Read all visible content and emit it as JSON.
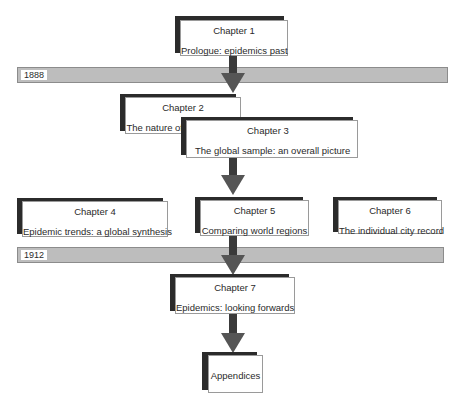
{
  "chapters": [
    {
      "title": "Chapter 1",
      "subtitle": "Prologue: epidemics past"
    },
    {
      "title": "Chapter 2",
      "subtitle": "The nature of the evidence"
    },
    {
      "title": "Chapter 3",
      "subtitle": "The global sample: an overall picture"
    },
    {
      "title": "Chapter 4",
      "subtitle": "Epidemic trends: a global synthesis"
    },
    {
      "title": "Chapter 5",
      "subtitle": "Comparing world regions"
    },
    {
      "title": "Chapter 6",
      "subtitle": "The individual city record"
    },
    {
      "title": "Chapter 7",
      "subtitle": "Epidemics: looking forwards"
    }
  ],
  "appendices": {
    "label": "Appendices"
  },
  "timeline": [
    {
      "year": "1888"
    },
    {
      "year": "1912"
    }
  ],
  "colors": {
    "bar": "#bdbdbd",
    "arrow": "#555555",
    "shadow": "#2b2b2b"
  }
}
